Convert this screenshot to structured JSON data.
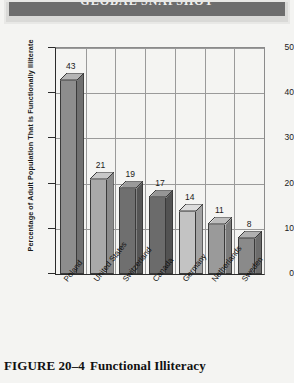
{
  "banner": {
    "text": "GLOBAL SNAPSHOT"
  },
  "caption": {
    "figure_number": "FIGURE 20–4",
    "title": "Functional Illiteracy"
  },
  "chart_data": {
    "type": "bar",
    "title": "",
    "xlabel": "",
    "ylabel": "Percentage of Adult Population That Is Functionally Illiterate",
    "ylim": [
      0,
      50
    ],
    "yticks": [
      0,
      10,
      20,
      30,
      40,
      50
    ],
    "grid": true,
    "legend": "none",
    "categories": [
      "Poland",
      "United States",
      "Switzerland",
      "Canada",
      "Germany",
      "Netherlands",
      "Sweden"
    ],
    "values": [
      43,
      21,
      19,
      17,
      14,
      11,
      8
    ],
    "value_labels": [
      "43",
      "21",
      "19",
      "17",
      "14",
      "11",
      "8"
    ],
    "bar_colors": [
      "#8d8d8d",
      "#a9a9a9",
      "#6f6f6f",
      "#6b6b6b",
      "#c3c3c3",
      "#9a9a9a",
      "#8a8a8a"
    ],
    "bar_side_colors": [
      "#6f6f6f",
      "#8a8a8a",
      "#555555",
      "#525252",
      "#a2a2a2",
      "#7b7b7b",
      "#6c6c6c"
    ],
    "bar_top_colors": [
      "#b5b5b5",
      "#c8c8c8",
      "#9a9a9a",
      "#959595",
      "#dcdcdc",
      "#bdbdbd",
      "#b0b0b0"
    ]
  }
}
